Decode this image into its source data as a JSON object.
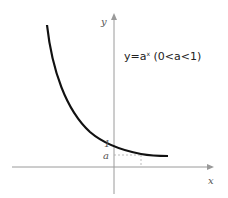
{
  "diagram": {
    "equation_label": "y=a",
    "equation_exponent": "x",
    "equation_condition": " (0<a<1)",
    "x_axis_label": "x",
    "y_axis_label": "y",
    "y_intercept_label": "1",
    "a_label": "a",
    "colors": {
      "curve": "#111111",
      "axis": "#9a9a9a",
      "guide": "#aaaaaa"
    }
  }
}
